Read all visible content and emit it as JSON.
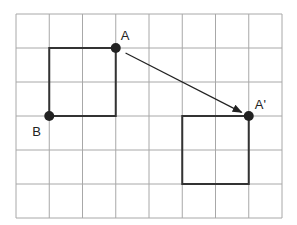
{
  "diagram": {
    "type": "translation-on-grid",
    "grid": {
      "columns": 8,
      "rows": 6,
      "origin_x": 16,
      "origin_y": 14,
      "cell_w": 33.25,
      "cell_h": 34,
      "line_color": "#a8a8a8"
    },
    "original_square": {
      "corners_grid": [
        [
          1,
          1
        ],
        [
          3,
          1
        ],
        [
          3,
          3
        ],
        [
          1,
          3
        ]
      ],
      "stroke": "#333333"
    },
    "image_square": {
      "corners_grid": [
        [
          5,
          3
        ],
        [
          7,
          3
        ],
        [
          7,
          5
        ],
        [
          5,
          5
        ]
      ],
      "stroke": "#333333"
    },
    "points": [
      {
        "id": "A",
        "label": "A",
        "grid": [
          3,
          1
        ]
      },
      {
        "id": "B",
        "label": "B",
        "grid": [
          1,
          3
        ]
      },
      {
        "id": "A_prime",
        "label": "A'",
        "grid": [
          7,
          3
        ]
      }
    ],
    "vector": {
      "from": "A",
      "to": "A'",
      "label": "translation arrow"
    },
    "point_color": "#222222"
  }
}
